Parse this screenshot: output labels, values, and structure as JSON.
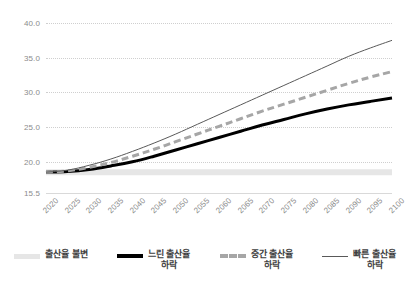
{
  "chart_data": {
    "type": "line",
    "title": "",
    "subtitle": "",
    "xlabel": "",
    "ylabel": "",
    "grid": true,
    "legend_position": "bottom",
    "xlim": [
      2020,
      2100
    ],
    "ylim": [
      15.5,
      40.0
    ],
    "y_ticks": [
      "40.0",
      "35.0",
      "30.0",
      "25.0",
      "20.0",
      "15.5"
    ],
    "y_tick_values": [
      40.0,
      35.0,
      30.0,
      25.0,
      20.0,
      15.5
    ],
    "x": [
      2020,
      2025,
      2030,
      2035,
      2040,
      2045,
      2050,
      2055,
      2060,
      2065,
      2070,
      2075,
      2080,
      2085,
      2090,
      2095,
      2100
    ],
    "x_tick_labels": [
      "2020",
      "2025",
      "2030",
      "2035",
      "2040",
      "2045",
      "2050",
      "2055",
      "2060",
      "2065",
      "2070",
      "2075",
      "2080",
      "2085",
      "2090",
      "2095",
      "2100"
    ],
    "series": [
      {
        "name": "출산율 불변",
        "style": "thick-light-gray",
        "color": "#e6e6e6",
        "values": [
          18.5,
          18.5,
          18.5,
          18.5,
          18.5,
          18.5,
          18.5,
          18.5,
          18.5,
          18.5,
          18.5,
          18.5,
          18.5,
          18.5,
          18.5,
          18.5,
          18.5
        ]
      },
      {
        "name": "느린 출산율 하락",
        "style": "thick-black",
        "color": "#000000",
        "values": [
          18.5,
          18.6,
          18.9,
          19.4,
          20.0,
          20.8,
          21.7,
          22.6,
          23.5,
          24.4,
          25.3,
          26.1,
          26.9,
          27.6,
          28.2,
          28.7,
          29.2
        ]
      },
      {
        "name": "중간 출산율 하락",
        "style": "dashed-gray",
        "color": "#a6a6a6",
        "values": [
          18.5,
          18.7,
          19.2,
          19.9,
          20.8,
          21.8,
          22.9,
          24.0,
          25.1,
          26.2,
          27.3,
          28.3,
          29.3,
          30.3,
          31.3,
          32.2,
          33.0
        ]
      },
      {
        "name": "빠른 출산율 하락",
        "style": "thin-dark",
        "color": "#595959",
        "values": [
          18.5,
          18.8,
          19.5,
          20.4,
          21.5,
          22.7,
          24.0,
          25.4,
          26.8,
          28.2,
          29.6,
          31.0,
          32.4,
          33.8,
          35.2,
          36.4,
          37.5
        ]
      }
    ]
  },
  "legend": {
    "items": [
      {
        "label_line1": "출산율 불변",
        "label_line2": ""
      },
      {
        "label_line1": "느린 출산율",
        "label_line2": "하락"
      },
      {
        "label_line1": "중간 출산율",
        "label_line2": "하락"
      },
      {
        "label_line1": "빠른 출산율",
        "label_line2": "하락"
      }
    ]
  }
}
